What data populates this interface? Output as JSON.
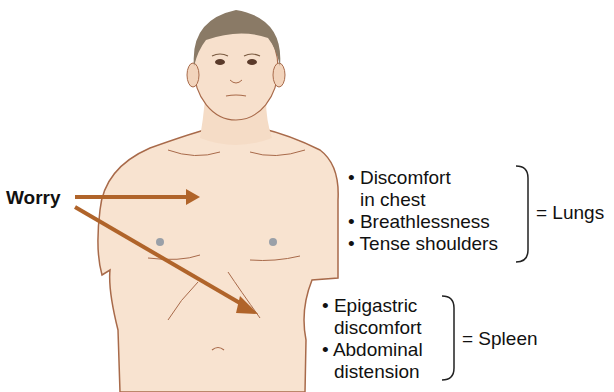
{
  "figure": {
    "cause_label": "Worry",
    "colors": {
      "skin": "#f7e0cc",
      "skin_outline": "#a86a4a",
      "hair": "#8a7a66",
      "arrow": "#b0642a",
      "text": "#111111"
    },
    "groups": [
      {
        "organ": "= Lungs",
        "symptoms": [
          "• Discomfort",
          "  in chest",
          "• Breathlessness",
          "• Tense shoulders"
        ]
      },
      {
        "organ": "= Spleen",
        "symptoms": [
          "• Epigastric",
          "  discomfort",
          "• Abdominal",
          "  distension"
        ]
      }
    ]
  }
}
